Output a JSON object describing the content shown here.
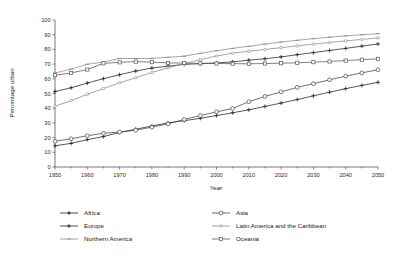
{
  "chart_data": {
    "type": "line",
    "title": "",
    "xlabel": "Year",
    "ylabel": "Percentage urban",
    "xlim": [
      1950,
      2050
    ],
    "ylim": [
      0,
      100
    ],
    "grid": false,
    "legend_position": "bottom",
    "x": [
      1950,
      1955,
      1960,
      1965,
      1970,
      1975,
      1980,
      1985,
      1990,
      1995,
      2000,
      2005,
      2010,
      2015,
      2020,
      2025,
      2030,
      2035,
      2040,
      2045,
      2050
    ],
    "xticks": [
      "1950",
      "1960",
      "1970",
      "1980",
      "1990",
      "2000",
      "2010",
      "2020",
      "2030",
      "2040",
      "2050"
    ],
    "yticks": [
      "0",
      "10",
      "20",
      "30",
      "40",
      "50",
      "60",
      "70",
      "80",
      "90",
      "100"
    ],
    "series": [
      {
        "name": "Africa",
        "marker": "plus",
        "color": "#222222",
        "values": [
          14.4,
          16.1,
          18.6,
          20.7,
          23.5,
          25.7,
          27.9,
          30.0,
          31.5,
          33.1,
          35.0,
          36.9,
          38.9,
          41.2,
          43.5,
          45.9,
          48.4,
          50.9,
          53.3,
          55.5,
          57.6
        ]
      },
      {
        "name": "Europe",
        "marker": "plus",
        "color": "#222222",
        "values": [
          51.3,
          53.9,
          57.1,
          60.1,
          62.8,
          65.3,
          67.3,
          68.6,
          69.8,
          70.3,
          70.8,
          71.5,
          72.7,
          73.6,
          74.9,
          76.4,
          77.8,
          79.3,
          80.7,
          82.2,
          83.7
        ]
      },
      {
        "name": "Northern America",
        "marker": "dash",
        "color": "#8a8a8a",
        "values": [
          63.9,
          66.6,
          69.9,
          71.4,
          73.8,
          73.8,
          73.9,
          74.6,
          75.4,
          77.3,
          79.1,
          80.7,
          82.1,
          83.6,
          85.0,
          86.2,
          87.3,
          88.3,
          89.2,
          90.0,
          90.7
        ]
      },
      {
        "name": "Asia",
        "marker": "circle-open",
        "color": "#444444",
        "values": [
          17.5,
          19.2,
          21.3,
          22.9,
          23.8,
          25.0,
          27.1,
          29.4,
          32.3,
          35.0,
          37.5,
          39.8,
          44.4,
          48.0,
          51.1,
          54.2,
          56.7,
          59.3,
          61.8,
          64.0,
          66.2
        ]
      },
      {
        "name": "Latin America and the Caribbean",
        "marker": "circle-small",
        "color": "#8a8a8a",
        "values": [
          41.3,
          45.2,
          49.4,
          53.4,
          57.3,
          60.7,
          64.3,
          67.5,
          70.3,
          73.0,
          75.5,
          77.4,
          78.8,
          79.9,
          81.2,
          82.4,
          83.6,
          84.7,
          85.8,
          86.8,
          87.8
        ]
      },
      {
        "name": "Oceania",
        "marker": "square-open",
        "color": "#555555",
        "values": [
          62.4,
          64.0,
          66.3,
          70.5,
          71.2,
          71.7,
          71.3,
          70.8,
          70.7,
          70.5,
          70.4,
          70.3,
          70.2,
          70.4,
          70.6,
          70.9,
          71.3,
          71.8,
          72.4,
          73.0,
          73.6
        ]
      }
    ],
    "legend": [
      {
        "name": "Africa",
        "column": "left",
        "row": 0,
        "marker": "plus",
        "color": "#222222"
      },
      {
        "name": "Europe",
        "column": "left",
        "row": 1,
        "marker": "plus",
        "color": "#222222"
      },
      {
        "name": "Northern America",
        "column": "left",
        "row": 2,
        "marker": "dash",
        "color": "#8a8a8a"
      },
      {
        "name": "Asia",
        "column": "right",
        "row": 0,
        "marker": "circle-open",
        "color": "#444444"
      },
      {
        "name": "Latin America and the Caribbean",
        "column": "right",
        "row": 1,
        "marker": "circle-small",
        "color": "#8a8a8a"
      },
      {
        "name": "Oceania",
        "column": "right",
        "row": 2,
        "marker": "square-open",
        "color": "#555555"
      }
    ]
  }
}
